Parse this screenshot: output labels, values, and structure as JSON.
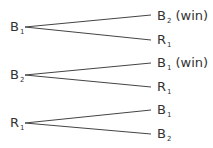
{
  "diagram": {
    "type": "tree",
    "branches": [
      {
        "root": {
          "base": "B",
          "sub": "1",
          "x": 10,
          "y": 20
        },
        "children": [
          {
            "base": "B",
            "sub": "2",
            "suffix": " (win)",
            "x": 157,
            "y": 9
          },
          {
            "base": "R",
            "sub": "1",
            "suffix": "",
            "x": 157,
            "y": 33
          }
        ]
      },
      {
        "root": {
          "base": "B",
          "sub": "2",
          "x": 10,
          "y": 68
        },
        "children": [
          {
            "base": "B",
            "sub": "1",
            "suffix": " (win)",
            "x": 157,
            "y": 56
          },
          {
            "base": "R",
            "sub": "1",
            "suffix": "",
            "x": 157,
            "y": 80
          }
        ]
      },
      {
        "root": {
          "base": "R",
          "sub": "1",
          "x": 10,
          "y": 116
        },
        "children": [
          {
            "base": "B",
            "sub": "1",
            "suffix": "",
            "x": 157,
            "y": 103
          },
          {
            "base": "B",
            "sub": "2",
            "suffix": "",
            "x": 157,
            "y": 127
          }
        ]
      }
    ],
    "line_color": "#444444"
  }
}
